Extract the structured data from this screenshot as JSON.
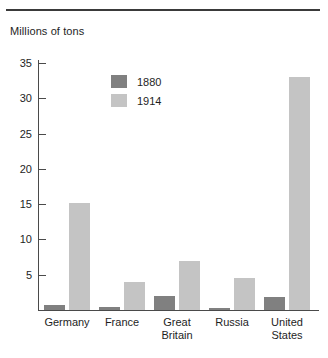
{
  "figure": {
    "axis_title": "Millions of tons",
    "divider": "top-rule"
  },
  "legend": {
    "entries": [
      {
        "label": "1880",
        "color": "#808080"
      },
      {
        "label": "1914",
        "color": "#c4c4c4"
      }
    ]
  },
  "axis": {
    "y_ticks": [
      "35",
      "30",
      "25",
      "20",
      "15",
      "10",
      "5"
    ],
    "x_labels": [
      "Germany",
      "France",
      "Great\nBritain",
      "Russia",
      "United\nStates"
    ]
  },
  "chart_data": {
    "type": "bar",
    "title": "",
    "xlabel": "",
    "ylabel": "Millions of tons",
    "ylim": [
      0,
      36
    ],
    "yticks": [
      5,
      10,
      15,
      20,
      25,
      30,
      35
    ],
    "grid": false,
    "legend_position": "inside-top-center",
    "categories": [
      "Germany",
      "France",
      "Great Britain",
      "Russia",
      "United States"
    ],
    "series": [
      {
        "name": "1880",
        "color": "#808080",
        "values": [
          0.7,
          0.4,
          2.0,
          0.3,
          1.9
        ]
      },
      {
        "name": "1914",
        "color": "#c4c4c4",
        "values": [
          15.2,
          4.0,
          7.0,
          4.5,
          33.0
        ]
      }
    ]
  }
}
